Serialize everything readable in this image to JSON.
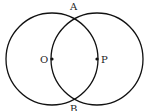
{
  "diagram": {
    "type": "two intersecting circles",
    "circles": [
      {
        "center_label": "O",
        "cx": 52,
        "cy": 59,
        "r": 46
      },
      {
        "center_label": "P",
        "cx": 97,
        "cy": 59,
        "r": 46
      }
    ],
    "points": [
      {
        "label": "A",
        "role": "top intersection"
      },
      {
        "label": "B",
        "role": "bottom intersection"
      },
      {
        "label": "O",
        "role": "center of left circle"
      },
      {
        "label": "P",
        "role": "center of right circle"
      }
    ],
    "labels": {
      "A": "A",
      "B": "B",
      "O": "O",
      "P": "P"
    },
    "stroke_color": "#111111"
  }
}
